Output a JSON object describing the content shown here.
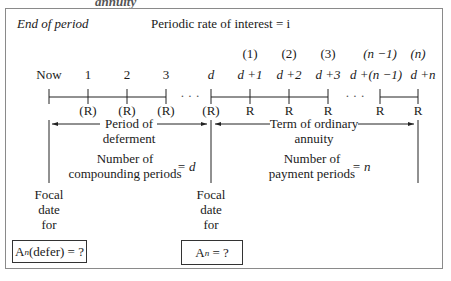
{
  "header": {
    "cut_title": "annuity",
    "period_label": "End of period",
    "rate_label": "Periodic rate of interest = i"
  },
  "timeline": {
    "ticks": [
      {
        "top": "",
        "label": "Now",
        "payment": ""
      },
      {
        "top": "",
        "label": "1",
        "payment": "(R)"
      },
      {
        "top": "",
        "label": "2",
        "payment": "(R)"
      },
      {
        "top": "",
        "label": "3",
        "payment": "(R)"
      },
      {
        "top": "",
        "label": "d",
        "payment": "(R)"
      },
      {
        "top": "(1)",
        "label": "d +1",
        "payment": "R"
      },
      {
        "top": "(2)",
        "label": "d +2",
        "payment": "R"
      },
      {
        "top": "(3)",
        "label": "d +3",
        "payment": "R"
      },
      {
        "top": "(n −1)",
        "label": "d +(n −1)",
        "payment": "R"
      },
      {
        "top": "(n)",
        "label": "d +n",
        "payment": "R"
      }
    ],
    "ellipsis": "· · ·"
  },
  "deferment": {
    "arrow_label_1": "Period of",
    "arrow_label_2": "deferment",
    "count_1": "Number of",
    "count_2": "compounding periods",
    "equals": "= d"
  },
  "annuity": {
    "arrow_label_1": "Term of ordinary",
    "arrow_label_2": "annuity",
    "count_1": "Number of",
    "count_2": "payment periods",
    "equals": "= n"
  },
  "focal_left": {
    "line1": "Focal",
    "line2": "date",
    "line3": "for",
    "box_main": "A",
    "box_sub": "n",
    "box_rest": "(defer) = ?"
  },
  "focal_right": {
    "line1": "Focal",
    "line2": "date",
    "line3": "for",
    "box_main": "A",
    "box_sub": "n",
    "box_rest": " = ?"
  }
}
